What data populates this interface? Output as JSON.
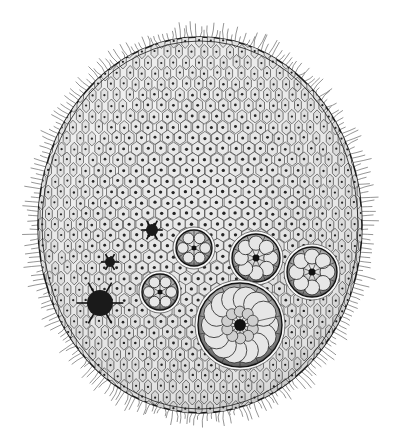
{
  "image": {
    "subject": "Volvox colony illustration",
    "style": "black-and-white engraving",
    "colors": {
      "background": "#ffffff",
      "ink": "#1a1a1a",
      "cell_fill": "#e9e9e9",
      "colony_fill": "#bdbdbd"
    },
    "daughter_colonies": [
      {
        "name": "small-colony-left",
        "kind": "star-cell"
      },
      {
        "name": "small-colony-upper",
        "kind": "star-cell"
      },
      {
        "name": "star-cell-upper",
        "kind": "star-cell"
      },
      {
        "name": "four-cell-colony",
        "kind": "colony"
      },
      {
        "name": "eight-cell-colony",
        "kind": "colony"
      },
      {
        "name": "radial-colony",
        "kind": "colony"
      },
      {
        "name": "right-colony",
        "kind": "colony"
      },
      {
        "name": "large-colony",
        "kind": "colony"
      }
    ]
  }
}
